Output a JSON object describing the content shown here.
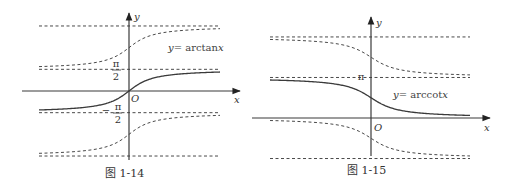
{
  "chart_data": [
    {
      "type": "line",
      "caption": "图 1-14",
      "function_label": "y = arctan x",
      "func_prefix": "y",
      "func_eq": "= arctan",
      "func_var": "x",
      "xlabel": "x",
      "ylabel": "y",
      "origin_label": "O",
      "y_tick_labels": [
        {
          "value": 1.5708,
          "numerator": "π",
          "denominator": "2",
          "sign": ""
        },
        {
          "value": -1.5708,
          "numerator": "π",
          "denominator": "2",
          "sign": "−"
        }
      ],
      "series": [
        {
          "name": "arctan",
          "style": "solid",
          "function": "arctan(x)",
          "x_range": [
            -5,
            5
          ]
        },
        {
          "name": "arctan+π",
          "style": "dashed",
          "function": "arctan(x)+π",
          "x_range": [
            -5,
            5
          ]
        },
        {
          "name": "arctan−π",
          "style": "dashed",
          "function": "arctan(x)−π",
          "x_range": [
            -5,
            5
          ]
        }
      ],
      "asymptotes": [
        {
          "y": 4.7124,
          "label": "3π/2"
        },
        {
          "y": 1.5708,
          "label": "π/2"
        },
        {
          "y": -1.5708,
          "label": "−π/2"
        },
        {
          "y": -4.7124,
          "label": "−3π/2"
        }
      ]
    },
    {
      "type": "line",
      "caption": "图 1-15",
      "function_label": "y = arccot x",
      "func_prefix": "y",
      "func_eq": "= arccot",
      "func_var": "x",
      "xlabel": "x",
      "ylabel": "y",
      "origin_label": "O",
      "y_tick_labels": [
        {
          "value": 3.1416,
          "text": "π"
        }
      ],
      "series": [
        {
          "name": "arccot",
          "style": "solid",
          "function": "arccot(x)",
          "x_range": [
            -5,
            5
          ]
        },
        {
          "name": "arccot+π",
          "style": "dashed",
          "function": "arccot(x)+π",
          "x_range": [
            -5,
            5
          ]
        },
        {
          "name": "arccot−π",
          "style": "dashed",
          "function": "arccot(x)−π",
          "x_range": [
            -5,
            5
          ]
        }
      ],
      "asymptotes": [
        {
          "y": 6.2832,
          "label": "2π"
        },
        {
          "y": 3.1416,
          "label": "π"
        },
        {
          "y": -3.1416,
          "label": "−π"
        }
      ]
    }
  ]
}
